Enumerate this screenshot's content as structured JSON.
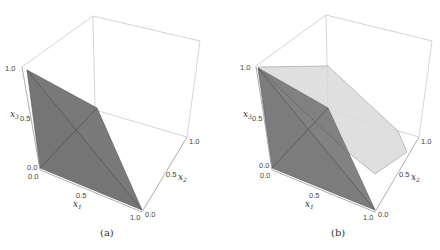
{
  "figure": {
    "panels": [
      {
        "id": "a",
        "caption": "(a)",
        "x1_label": "x",
        "x1_sub": "1",
        "x2_label": "x",
        "x2_sub": "2",
        "x3_label": "x",
        "x3_sub": "3",
        "ticks": {
          "x3": [
            "1.0",
            "0.5",
            "0.0"
          ],
          "x1": [
            "0.0",
            "0.5",
            "1.0"
          ],
          "x2": [
            "0.0",
            "0.5",
            "1.0"
          ]
        }
      },
      {
        "id": "b",
        "caption": "(b)",
        "x1_label": "x",
        "x1_sub": "1",
        "x2_label": "x",
        "x2_sub": "2",
        "x3_label": "x",
        "x3_sub": "3",
        "ticks": {
          "x3": [
            "1.0",
            "0.5",
            "0.0"
          ],
          "x1": [
            "0.0",
            "0.5",
            "1.0"
          ],
          "x2": [
            "0.0",
            "0.5",
            "1.0"
          ]
        }
      }
    ],
    "colors": {
      "dark_surface": "#6e6e6e",
      "light_surface": "#d9d9d9",
      "box_lines": "#c8c8c8"
    }
  }
}
